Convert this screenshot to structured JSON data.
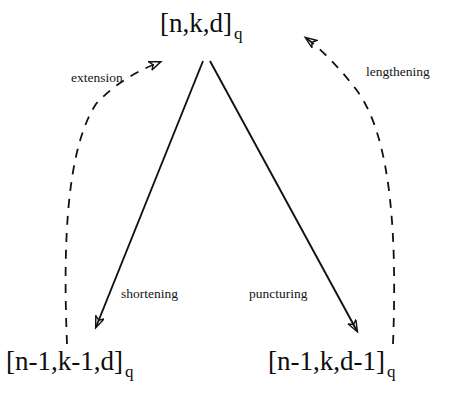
{
  "diagram": {
    "type": "code-transformation-diagram",
    "title": "",
    "background_color": "#ffffff",
    "stroke_color": "#111111",
    "nodes": [
      {
        "id": "top",
        "name": "original-code",
        "label_main": "[n,k,d]",
        "label_sub": "q",
        "position": "top-center"
      },
      {
        "id": "bottom-left",
        "name": "shortened-code",
        "label_main": "[n-1,k-1,d]",
        "label_sub": "q",
        "position": "bottom-left"
      },
      {
        "id": "bottom-right",
        "name": "punctured-code",
        "label_main": "[n-1,k,d-1]",
        "label_sub": "q",
        "position": "bottom-right"
      }
    ],
    "edges": [
      {
        "id": "shortening",
        "label": "shortening",
        "from": "top",
        "to": "bottom-left",
        "style": "solid",
        "direction": "down-left"
      },
      {
        "id": "puncturing",
        "label": "puncturing",
        "from": "top",
        "to": "bottom-right",
        "style": "solid",
        "direction": "down-right"
      },
      {
        "id": "extension",
        "label": "extension",
        "from": "bottom-left",
        "to": "top",
        "style": "dashed",
        "direction": "up-right"
      },
      {
        "id": "lengthening",
        "label": "lengthening",
        "from": "bottom-right",
        "to": "top",
        "style": "dashed",
        "direction": "up-left"
      }
    ]
  }
}
